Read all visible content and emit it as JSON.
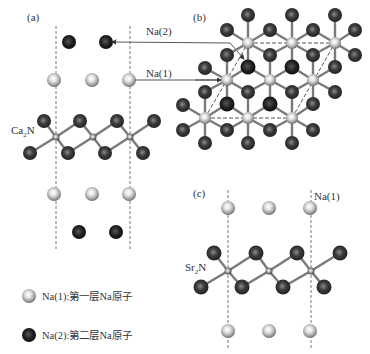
{
  "panels": {
    "a": {
      "label": "(a)",
      "layer_label": "Ca",
      "layer_sub": "2",
      "layer_suffix": "N"
    },
    "b": {
      "label": "(b)"
    },
    "c": {
      "label": "(c)",
      "layer_label": "Sr",
      "layer_sub": "2",
      "layer_suffix": "N",
      "na_label": "Na(1)"
    }
  },
  "annotations": {
    "na2": "Na(2)",
    "na1": "Na(1)"
  },
  "legend": [
    {
      "symbol": "light-sphere",
      "text": "Na(1):第一层Na原子"
    },
    {
      "symbol": "dark-sphere",
      "text": "Na(2):第二层Na原子"
    }
  ],
  "colors": {
    "na1": "#c8c8c8",
    "na2": "#1e1e1e",
    "metal": "#3a3a3a",
    "bond": "#7a7a7a",
    "dash": "#555555"
  }
}
